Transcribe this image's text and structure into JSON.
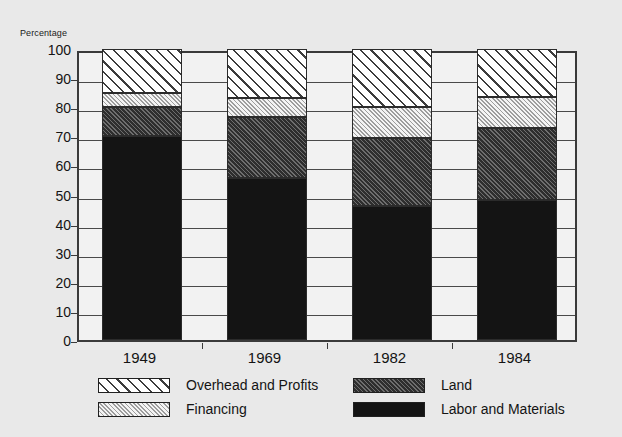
{
  "axis": {
    "y_title": "Percentage",
    "y_ticks": [
      100,
      90,
      80,
      70,
      60,
      50,
      40,
      30,
      20,
      10,
      0
    ]
  },
  "legend": {
    "items": [
      {
        "label": "Overhead and Profits",
        "key": "overhead",
        "swatch": "sparse-diagonal-hatch"
      },
      {
        "label": "Financing",
        "key": "financing",
        "swatch": "fine-diagonal-hatch"
      },
      {
        "label": "Land",
        "key": "land",
        "swatch": "dense-dark-diagonal-hatch"
      },
      {
        "label": "Labor and Materials",
        "key": "labor",
        "swatch": "solid-black"
      }
    ]
  },
  "chart_data": {
    "type": "bar",
    "stacked": true,
    "title": "",
    "subtitle": "",
    "xlabel": "",
    "ylabel": "Percentage",
    "ylim": [
      0,
      100
    ],
    "ytick_step": 10,
    "grid": true,
    "legend_position": "bottom",
    "categories": [
      "1949",
      "1969",
      "1982",
      "1984"
    ],
    "series": [
      {
        "name": "Labor and Materials",
        "values": [
          70,
          55.5,
          46,
          48
        ]
      },
      {
        "name": "Land",
        "values": [
          10,
          21,
          23.5,
          25
        ]
      },
      {
        "name": "Financing",
        "values": [
          5,
          6.5,
          10.5,
          10.5
        ]
      },
      {
        "name": "Overhead and Profits",
        "values": [
          15,
          17,
          20,
          16.5
        ]
      }
    ],
    "cumulative_tops": {
      "1949": {
        "labor": 70,
        "land": 80,
        "financing": 85,
        "overhead": 100
      },
      "1969": {
        "labor": 55.5,
        "land": 76.5,
        "financing": 83,
        "overhead": 100
      },
      "1982": {
        "labor": 46,
        "land": 69.5,
        "financing": 80,
        "overhead": 100
      },
      "1984": {
        "labor": 48,
        "land": 73,
        "financing": 83.5,
        "overhead": 100
      }
    }
  }
}
